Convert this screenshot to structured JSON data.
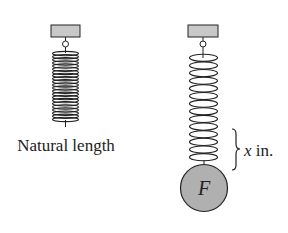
{
  "diagram": {
    "left_spring": {
      "label": "Natural length",
      "coil_count": 22
    },
    "right_spring": {
      "coil_count": 14,
      "weight_label": "F",
      "extension_label_var": "x",
      "extension_label_unit": " in."
    },
    "colors": {
      "mount_fill": "#c8c8c8",
      "weight_fill": "#b0b0b0",
      "line": "#222222"
    }
  }
}
